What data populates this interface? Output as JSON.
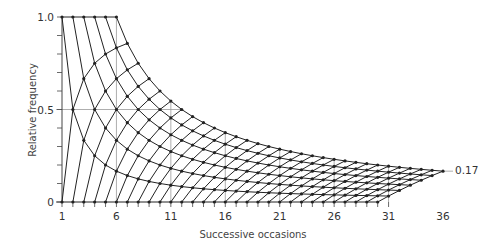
{
  "chart_data": {
    "type": "line",
    "title": "",
    "xlabel": "Successive occasions",
    "ylabel": "Relative frequency",
    "x_ticks": [
      1,
      6,
      11,
      16,
      21,
      26,
      31,
      36
    ],
    "y_ticks": [
      0,
      0.5,
      1.0
    ],
    "y_tick_labels": [
      "0",
      "0.5",
      "1.0"
    ],
    "xlim": [
      1,
      36
    ],
    "ylim": [
      0,
      1.0
    ],
    "annotation": "0.17",
    "annotation_point": [
      36,
      0.17
    ],
    "gridlines_x": [
      6,
      11,
      16,
      21,
      26,
      31
    ],
    "gridlines_y": [
      0.5
    ],
    "lattice": {
      "description": "Relative frequency k/n after n occasions with k successes; lines of constant successes k and constant failures n-k",
      "max_successes": 6,
      "max_failures": 30,
      "upper_boundary": "6/n from n=6 (1.0) to n=36 (0.17)",
      "top_row": "k=n for n=1..6 at 1.0",
      "bottom_row": "k=0 for n=1..30 at 0"
    }
  },
  "colors": {
    "line": "#222222",
    "grid": "#999999",
    "axis": "#444444"
  }
}
